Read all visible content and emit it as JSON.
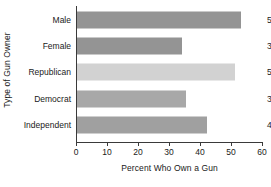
{
  "chart_data": {
    "type": "bar",
    "orientation": "horizontal",
    "title": "",
    "xlabel": "Percent Who Own a Gun",
    "ylabel": "Type of Gun Owner",
    "categories": [
      "Male",
      "Female",
      "Republican",
      "Democrat",
      "Independent"
    ],
    "values": [
      53,
      34,
      51,
      35,
      42
    ],
    "value_labels": [
      "53",
      "34",
      "51",
      "35",
      "42"
    ],
    "bar_colors": [
      "#949494",
      "#949494",
      "#d2d2d2",
      "#a8a8a8",
      "#a0a0a0"
    ],
    "xlim": [
      0,
      60
    ],
    "xticks": [
      0,
      10,
      20,
      30,
      40,
      50,
      60
    ],
    "xtick_labels": [
      "0",
      "10",
      "20",
      "30",
      "40",
      "50",
      "60"
    ],
    "grid": false,
    "legend": null
  }
}
